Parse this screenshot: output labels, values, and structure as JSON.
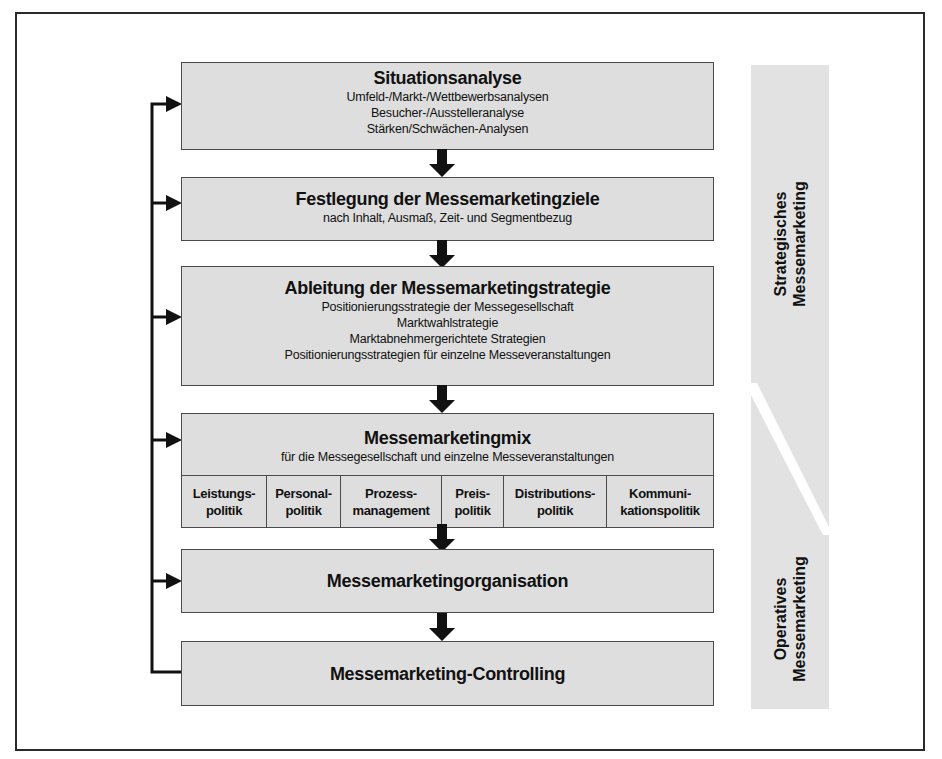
{
  "diagram": {
    "type": "process-flow",
    "steps": [
      {
        "title": "Situationsanalyse",
        "lines": [
          "Umfeld-/Markt-/Wettbewerbsanalysen",
          "Besucher-/Ausstelleranalyse",
          "Stärken/Schwächen-Analysen"
        ]
      },
      {
        "title": "Festlegung der Messemarketingziele",
        "lines": [
          "nach Inhalt, Ausmaß, Zeit- und Segmentbezug"
        ]
      },
      {
        "title": "Ableitung der Messemarketingstrategie",
        "lines": [
          "Positionierungsstrategie der Messegesellschaft",
          "Marktwahlstrategie",
          "Marktabnehmergerichtete Strategien",
          "Positionierungsstrategien für einzelne Messeveranstaltungen"
        ]
      },
      {
        "title": "Messemarketingmix",
        "lines": [
          "für die Messegesellschaft und einzelne Messeveranstaltungen"
        ],
        "mix": [
          "Leistungs-\npolitik",
          "Personal-\npolitik",
          "Prozess-\nmanagement",
          "Preis-\npolitik",
          "Distributions-\npolitik",
          "Kommuni-\nkationspolitik"
        ]
      },
      {
        "title": "Messemarketingorganisation",
        "lines": []
      },
      {
        "title": "Messemarketing-Controlling",
        "lines": []
      }
    ],
    "side_labels": {
      "strategic": "Strategisches\nMessemarketing",
      "operative": "Operatives\nMessemarketing"
    },
    "colors": {
      "box_fill": "#dedede",
      "box_border": "#4a4a4a",
      "strip_fill": "#e2e2e2",
      "arrow": "#111111"
    }
  }
}
